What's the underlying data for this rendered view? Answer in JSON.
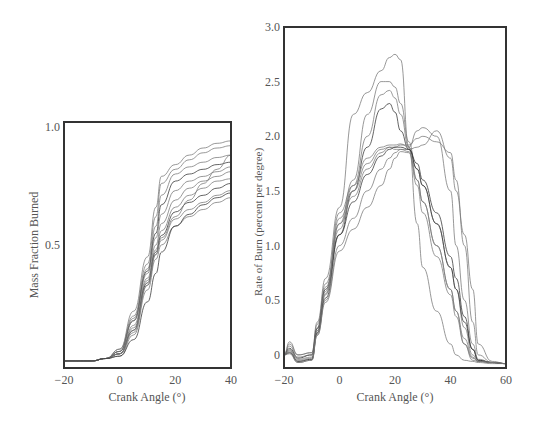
{
  "chart_data": [
    {
      "type": "line",
      "title": "",
      "xlabel": "Crank Angle (°)",
      "ylabel": "Mass Fraction Burned",
      "xlim": [
        -20,
        40
      ],
      "ylim": [
        -0.02,
        1.02
      ],
      "xticks": [
        -20,
        0,
        20,
        40
      ],
      "xtick_labels": [
        "−20",
        "0",
        "20",
        "40"
      ],
      "yticks": [
        0.5,
        1.0
      ],
      "ytick_labels": [
        "0.5",
        "1.0"
      ],
      "grid": false,
      "legend": "none",
      "x": [
        -20,
        -10,
        -5,
        0,
        5,
        10,
        13,
        15,
        20,
        25,
        30,
        35,
        40
      ],
      "series": [
        {
          "name": "cycle 1",
          "values": [
            0.01,
            0.01,
            0.02,
            0.06,
            0.22,
            0.45,
            0.66,
            0.79,
            0.84,
            0.88,
            0.91,
            0.93,
            0.94
          ]
        },
        {
          "name": "cycle 2",
          "values": [
            0.01,
            0.01,
            0.02,
            0.06,
            0.2,
            0.42,
            0.62,
            0.76,
            0.82,
            0.86,
            0.89,
            0.91,
            0.92
          ]
        },
        {
          "name": "cycle 3",
          "values": [
            0.01,
            0.01,
            0.02,
            0.05,
            0.19,
            0.4,
            0.58,
            0.71,
            0.8,
            0.83,
            0.85,
            0.87,
            0.88
          ]
        },
        {
          "name": "cycle 4",
          "values": [
            0.01,
            0.01,
            0.02,
            0.05,
            0.18,
            0.39,
            0.55,
            0.67,
            0.77,
            0.8,
            0.82,
            0.84,
            0.85
          ]
        },
        {
          "name": "cycle 5",
          "values": [
            0.01,
            0.01,
            0.02,
            0.05,
            0.18,
            0.38,
            0.53,
            0.63,
            0.73,
            0.77,
            0.79,
            0.81,
            0.83
          ]
        },
        {
          "name": "cycle 6",
          "values": [
            0.01,
            0.01,
            0.02,
            0.04,
            0.16,
            0.36,
            0.5,
            0.59,
            0.69,
            0.74,
            0.77,
            0.79,
            0.81
          ]
        },
        {
          "name": "cycle 7",
          "values": [
            0.01,
            0.01,
            0.02,
            0.04,
            0.15,
            0.35,
            0.48,
            0.56,
            0.66,
            0.71,
            0.74,
            0.77,
            0.78
          ]
        },
        {
          "name": "cycle 8",
          "values": [
            0.01,
            0.01,
            0.02,
            0.04,
            0.14,
            0.34,
            0.47,
            0.54,
            0.64,
            0.68,
            0.71,
            0.74,
            0.76
          ]
        },
        {
          "name": "cycle 9",
          "values": [
            0.01,
            0.01,
            0.02,
            0.04,
            0.13,
            0.33,
            0.46,
            0.52,
            0.61,
            0.65,
            0.68,
            0.71,
            0.73
          ]
        },
        {
          "name": "cycle 10",
          "values": [
            0.01,
            0.01,
            0.02,
            0.03,
            0.12,
            0.31,
            0.44,
            0.5,
            0.58,
            0.62,
            0.65,
            0.68,
            0.7
          ]
        },
        {
          "name": "cycle 11",
          "values": [
            0.01,
            0.01,
            0.02,
            0.04,
            0.14,
            0.33,
            0.46,
            0.53,
            0.62,
            0.69,
            0.76,
            0.82,
            0.88
          ]
        },
        {
          "name": "cycle 12",
          "values": [
            0.01,
            0.01,
            0.02,
            0.03,
            0.1,
            0.26,
            0.38,
            0.47,
            0.58,
            0.63,
            0.67,
            0.7,
            0.72
          ]
        }
      ]
    },
    {
      "type": "line",
      "title": "",
      "xlabel": "Crank Angle (°)",
      "ylabel": "Rate of Burn (percent per degree)",
      "xlim": [
        -20,
        60
      ],
      "ylim": [
        -0.12,
        3.0
      ],
      "xticks": [
        -20,
        0,
        20,
        40,
        60
      ],
      "xtick_labels": [
        "−20",
        "0",
        "20",
        "40",
        "60"
      ],
      "yticks": [
        0,
        0.5,
        1.0,
        1.5,
        2.0,
        2.5,
        3.0
      ],
      "ytick_labels": [
        "0",
        "0.5",
        "1.0",
        "1.5",
        "2.0",
        "2.5",
        "3.0"
      ],
      "grid": false,
      "legend": "none",
      "x": [
        -20,
        -18,
        -15,
        -10,
        -8,
        -5,
        0,
        5,
        10,
        15,
        18,
        20,
        22,
        25,
        28,
        30,
        35,
        40,
        42,
        45,
        48,
        50,
        55,
        60
      ],
      "series": [
        {
          "name": "cycle 1",
          "values": [
            0.0,
            0.12,
            0.0,
            0.02,
            0.3,
            0.7,
            1.35,
            2.2,
            2.4,
            2.6,
            2.72,
            2.75,
            2.7,
            1.9,
            1.2,
            0.8,
            0.4,
            0.1,
            0.0,
            -0.05,
            -0.06,
            -0.07,
            -0.08,
            -0.08
          ]
        },
        {
          "name": "cycle 2",
          "values": [
            0.0,
            0.1,
            0.0,
            0.02,
            0.28,
            0.65,
            1.2,
            1.6,
            2.2,
            2.5,
            2.5,
            2.45,
            2.3,
            1.95,
            1.6,
            1.4,
            1.0,
            0.6,
            0.4,
            0.1,
            -0.05,
            -0.06,
            -0.07,
            -0.08
          ]
        },
        {
          "name": "cycle 3",
          "values": [
            0.0,
            0.08,
            -0.02,
            0.0,
            0.25,
            0.62,
            1.15,
            1.55,
            2.0,
            2.38,
            2.42,
            2.35,
            2.2,
            1.9,
            1.7,
            1.55,
            1.2,
            0.8,
            0.6,
            0.25,
            0.0,
            -0.06,
            -0.07,
            -0.08
          ]
        },
        {
          "name": "cycle 4",
          "values": [
            0.0,
            0.06,
            -0.03,
            0.0,
            0.24,
            0.6,
            1.1,
            1.5,
            1.9,
            2.25,
            2.3,
            2.22,
            2.05,
            1.88,
            1.75,
            1.6,
            1.3,
            0.9,
            0.7,
            0.35,
            0.05,
            -0.05,
            -0.07,
            -0.08
          ]
        },
        {
          "name": "cycle 5",
          "values": [
            0.0,
            0.05,
            -0.04,
            -0.02,
            0.22,
            0.58,
            1.3,
            1.55,
            1.8,
            1.9,
            1.92,
            1.92,
            1.93,
            1.9,
            2.05,
            2.08,
            2.0,
            1.5,
            1.0,
            0.5,
            0.1,
            -0.04,
            -0.07,
            -0.08
          ]
        },
        {
          "name": "cycle 6",
          "values": [
            0.0,
            0.04,
            -0.05,
            -0.03,
            0.22,
            0.56,
            1.25,
            1.5,
            1.75,
            1.88,
            1.9,
            1.9,
            1.92,
            1.92,
            1.98,
            2.0,
            1.95,
            1.85,
            1.6,
            1.0,
            0.3,
            0.0,
            -0.07,
            -0.08
          ]
        },
        {
          "name": "cycle 7",
          "values": [
            0.0,
            0.03,
            -0.06,
            -0.04,
            0.2,
            0.55,
            1.2,
            1.45,
            1.7,
            1.85,
            1.9,
            1.88,
            1.88,
            1.88,
            1.9,
            1.92,
            2.05,
            1.8,
            1.5,
            1.1,
            0.6,
            0.1,
            -0.06,
            -0.08
          ]
        },
        {
          "name": "cycle 8",
          "values": [
            0.0,
            0.02,
            -0.06,
            -0.04,
            0.2,
            0.52,
            1.1,
            1.4,
            1.65,
            1.82,
            1.88,
            1.9,
            1.9,
            1.88,
            1.7,
            1.55,
            1.2,
            0.8,
            0.6,
            0.3,
            0.05,
            -0.05,
            -0.07,
            -0.08
          ]
        },
        {
          "name": "cycle 9",
          "values": [
            0.0,
            0.02,
            -0.07,
            -0.05,
            0.18,
            0.5,
            1.0,
            1.25,
            1.5,
            1.7,
            1.8,
            1.85,
            1.88,
            1.86,
            1.6,
            1.4,
            1.0,
            0.6,
            0.4,
            0.15,
            -0.02,
            -0.06,
            -0.07,
            -0.08
          ]
        },
        {
          "name": "cycle 10",
          "values": [
            0.0,
            0.01,
            -0.07,
            -0.05,
            0.18,
            0.48,
            0.95,
            1.15,
            1.35,
            1.55,
            1.7,
            1.8,
            1.86,
            1.85,
            1.55,
            1.3,
            0.9,
            0.55,
            0.35,
            0.1,
            -0.03,
            -0.06,
            -0.07,
            -0.08
          ]
        }
      ]
    }
  ]
}
